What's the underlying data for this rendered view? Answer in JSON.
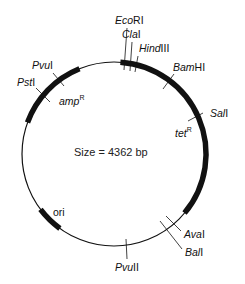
{
  "diagram": {
    "type": "plasmid-map",
    "size_label": "Size = 4362 bp",
    "colors": {
      "line": "#111111",
      "background": "#ffffff"
    },
    "circle": {
      "cx": 114,
      "cy": 154,
      "r": 92
    },
    "genes": [
      {
        "name": "ampR",
        "label_main": "amp",
        "label_sup": "R",
        "start_deg": 200,
        "end_deg": 248
      },
      {
        "name": "tetR",
        "label_main": "tet",
        "label_sup": "R",
        "start_deg": 274,
        "end_deg": 400
      },
      {
        "name": "ori",
        "label_main": "ori",
        "label_sup": "",
        "start_deg": 126,
        "end_deg": 143
      }
    ],
    "sites": [
      {
        "key": "ecori",
        "prefix": "Eco",
        "suffix": "RI"
      },
      {
        "key": "clai",
        "prefix": "Cla",
        "suffix": "I"
      },
      {
        "key": "hindiii",
        "prefix": "Hind",
        "suffix": "III"
      },
      {
        "key": "bamhi",
        "prefix": "Bam",
        "suffix": "HI"
      },
      {
        "key": "sali",
        "prefix": "Sal",
        "suffix": "I"
      },
      {
        "key": "avai",
        "prefix": "Ava",
        "suffix": "I"
      },
      {
        "key": "bali",
        "prefix": "Bal",
        "suffix": "I"
      },
      {
        "key": "pvuii",
        "prefix": "Pvu",
        "suffix": "II"
      },
      {
        "key": "psti",
        "prefix": "Pst",
        "suffix": "I"
      },
      {
        "key": "pvui",
        "prefix": "Pvu",
        "suffix": "I"
      }
    ]
  }
}
